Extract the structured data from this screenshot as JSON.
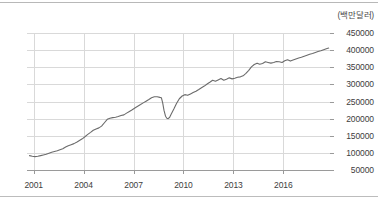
{
  "chart_data": {
    "type": "line",
    "title": "",
    "subtitle": "",
    "xlabel": "",
    "ylabel": "",
    "unit_label": "(백만달러)",
    "grid": true,
    "legend": null,
    "xlim": [
      2000.6,
      2018.8
    ],
    "ylim": [
      50000,
      450000
    ],
    "ytick_labels": [
      "450000",
      "400000",
      "350000",
      "300000",
      "250000",
      "200000",
      "150000",
      "100000",
      "50000"
    ],
    "ytick_values": [
      450000,
      400000,
      350000,
      300000,
      250000,
      200000,
      150000,
      100000,
      50000
    ],
    "xtick_labels": [
      "2001",
      "2004",
      "2007",
      "2010",
      "2013",
      "2016"
    ],
    "xtick_values": [
      2001,
      2004,
      2007,
      2010,
      2013,
      2016
    ],
    "line_color": "#6b6b6b",
    "grid_color": "#d9d9d9",
    "axis_color": "#9a9a9a",
    "series": [
      {
        "name": "",
        "x": [
          2000.75,
          2000.92,
          2001.08,
          2001.25,
          2001.42,
          2001.58,
          2001.75,
          2001.92,
          2002.08,
          2002.25,
          2002.42,
          2002.58,
          2002.75,
          2002.92,
          2003.08,
          2003.25,
          2003.42,
          2003.58,
          2003.75,
          2003.92,
          2004.08,
          2004.25,
          2004.42,
          2004.58,
          2004.75,
          2004.92,
          2005.08,
          2005.25,
          2005.42,
          2005.58,
          2005.75,
          2005.92,
          2006.08,
          2006.25,
          2006.42,
          2006.58,
          2006.75,
          2006.92,
          2007.08,
          2007.25,
          2007.42,
          2007.58,
          2007.75,
          2007.92,
          2008.08,
          2008.25,
          2008.42,
          2008.58,
          2008.67,
          2008.75,
          2008.83,
          2008.92,
          2009.0,
          2009.08,
          2009.17,
          2009.25,
          2009.42,
          2009.58,
          2009.75,
          2009.92,
          2010.08,
          2010.25,
          2010.42,
          2010.58,
          2010.75,
          2010.92,
          2011.08,
          2011.25,
          2011.42,
          2011.58,
          2011.75,
          2011.92,
          2012.08,
          2012.25,
          2012.42,
          2012.58,
          2012.75,
          2012.92,
          2013.08,
          2013.25,
          2013.42,
          2013.58,
          2013.75,
          2013.92,
          2014.08,
          2014.25,
          2014.42,
          2014.58,
          2014.75,
          2014.92,
          2015.08,
          2015.25,
          2015.42,
          2015.58,
          2015.75,
          2015.92,
          2016.08,
          2016.25,
          2016.42,
          2016.58,
          2016.75,
          2016.92,
          2017.08,
          2017.25,
          2017.42,
          2017.58,
          2017.75,
          2017.92,
          2018.08,
          2018.25,
          2018.42,
          2018.58,
          2018.72
        ],
        "y": [
          92000,
          90000,
          89000,
          90000,
          92000,
          94000,
          96000,
          99000,
          102000,
          104000,
          106000,
          109000,
          112000,
          117000,
          121000,
          124000,
          127000,
          131000,
          136000,
          141000,
          147000,
          154000,
          160000,
          166000,
          170000,
          173000,
          178000,
          188000,
          198000,
          201000,
          203000,
          204000,
          206000,
          209000,
          211000,
          216000,
          221000,
          226000,
          231000,
          236000,
          241000,
          246000,
          251000,
          256000,
          261000,
          264000,
          264000,
          262000,
          261000,
          246000,
          224000,
          207000,
          201000,
          200000,
          204000,
          212000,
          228000,
          244000,
          258000,
          266000,
          270000,
          268000,
          272000,
          276000,
          280000,
          285000,
          290000,
          295000,
          301000,
          306000,
          312000,
          309000,
          313000,
          317000,
          312000,
          315000,
          319000,
          316000,
          318000,
          321000,
          322000,
          325000,
          332000,
          341000,
          351000,
          358000,
          362000,
          359000,
          361000,
          366000,
          364000,
          362000,
          364000,
          367000,
          366000,
          364000,
          369000,
          372000,
          368000,
          371000,
          374000,
          377000,
          379000,
          382000,
          385000,
          388000,
          390000,
          393000,
          396000,
          398000,
          401000,
          404000,
          406000
        ]
      }
    ]
  }
}
